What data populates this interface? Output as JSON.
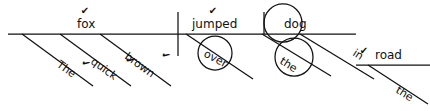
{
  "diagram": {
    "type": "reed-kellogg-sentence-diagram",
    "sentence": "The quick brown fox jumped over the dog in the road",
    "canvas": {
      "width": 430,
      "height": 111,
      "background": "#ffffff",
      "ink": "#111111"
    },
    "check_glyph": "✔",
    "words": [
      {
        "id": "the-1",
        "label": "The",
        "role": "article-modifier-of-fox",
        "x": 56,
        "y": 66,
        "rotate": 36,
        "check": true,
        "check_x": 84,
        "check_y": 66
      },
      {
        "id": "quick",
        "label": "quick",
        "role": "adjective-modifier-of-fox",
        "x": 90,
        "y": 63,
        "rotate": 36,
        "check": true,
        "check_x": 128,
        "check_y": 63
      },
      {
        "id": "brown",
        "label": "brown",
        "role": "adjective-modifier-of-fox",
        "x": 124,
        "y": 58,
        "rotate": 36,
        "check": true,
        "check_x": 164,
        "check_y": 58
      },
      {
        "id": "fox",
        "label": "fox",
        "role": "subject",
        "x": 77,
        "y": 28,
        "rotate": 0,
        "check": true,
        "check_x": 85,
        "check_y": 14
      },
      {
        "id": "jumped",
        "label": "jumped",
        "role": "verb",
        "x": 192,
        "y": 28,
        "rotate": 0,
        "check": true,
        "check_x": 213,
        "check_y": 14
      },
      {
        "id": "over",
        "label": "over",
        "role": "preposition",
        "x": 203,
        "y": 56,
        "rotate": 28,
        "check": false,
        "check_x": 0,
        "check_y": 0
      },
      {
        "id": "dog",
        "label": "dog",
        "role": "object-of-preposition-over",
        "x": 284,
        "y": 28,
        "rotate": 0,
        "check": false,
        "check_x": 0,
        "check_y": 0
      },
      {
        "id": "the-2",
        "label": "the",
        "role": "article-modifier-of-dog",
        "x": 279,
        "y": 63,
        "rotate": 32,
        "check": false,
        "check_x": 0,
        "check_y": 0
      },
      {
        "id": "in",
        "label": "in",
        "role": "preposition",
        "x": 352,
        "y": 55,
        "rotate": 32,
        "check": false,
        "check_x": 0,
        "check_y": 0
      },
      {
        "id": "road",
        "label": "road",
        "role": "object-of-preposition-in",
        "x": 375,
        "y": 59,
        "rotate": 0,
        "check": true,
        "check_x": 364,
        "check_y": 54
      },
      {
        "id": "the-3",
        "label": "the",
        "role": "article-modifier-of-road",
        "x": 395,
        "y": 92,
        "rotate": 32,
        "check": false,
        "check_x": 0,
        "check_y": 0
      }
    ],
    "strokes": [
      {
        "id": "baseline-main",
        "kind": "horizontal",
        "x1": 8,
        "y1": 34,
        "x2": 356,
        "y2": 34
      },
      {
        "id": "baseline-road",
        "kind": "horizontal",
        "x1": 356,
        "y1": 65,
        "x2": 430,
        "y2": 65
      },
      {
        "id": "divider-subject-verb",
        "kind": "vertical",
        "x1": 178,
        "y1": 12,
        "x2": 178,
        "y2": 56
      },
      {
        "id": "divider-dog",
        "kind": "vertical",
        "x1": 264,
        "y1": 12,
        "x2": 264,
        "y2": 34
      },
      {
        "id": "slant-the-1",
        "kind": "slant",
        "x1": 22,
        "y1": 34,
        "x2": 93,
        "y2": 86
      },
      {
        "id": "slant-quick",
        "kind": "slant",
        "x1": 60,
        "y1": 34,
        "x2": 131,
        "y2": 86
      },
      {
        "id": "slant-brown",
        "kind": "slant",
        "x1": 100,
        "y1": 34,
        "x2": 171,
        "y2": 86
      },
      {
        "id": "slant-over",
        "kind": "slant",
        "x1": 186,
        "y1": 34,
        "x2": 253,
        "y2": 79
      },
      {
        "id": "slant-the-2",
        "kind": "slant",
        "x1": 262,
        "y1": 34,
        "x2": 331,
        "y2": 76
      },
      {
        "id": "slant-in",
        "kind": "slant",
        "x1": 300,
        "y1": 34,
        "x2": 374,
        "y2": 79
      },
      {
        "id": "slant-the-3",
        "kind": "slant",
        "x1": 368,
        "y1": 65,
        "x2": 428,
        "y2": 104
      }
    ],
    "circles": [
      {
        "id": "circle-over",
        "cx": 215,
        "cy": 53,
        "r": 17,
        "encircles": "over"
      },
      {
        "id": "circle-dog",
        "cx": 283,
        "cy": 23,
        "r": 19,
        "encircles": "dog"
      },
      {
        "id": "circle-the2",
        "cx": 294,
        "cy": 57,
        "r": 19,
        "encircles": "the-2"
      }
    ]
  }
}
